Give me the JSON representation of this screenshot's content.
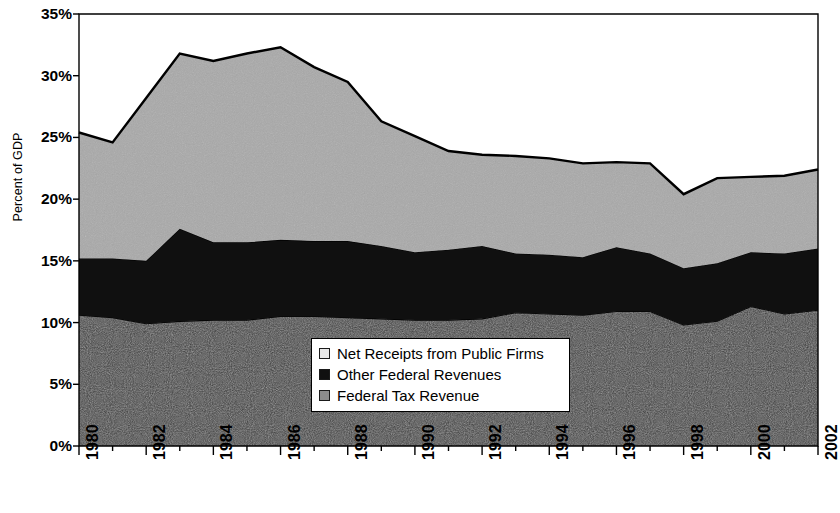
{
  "chart_data": {
    "type": "area",
    "stacked": true,
    "title": "",
    "subtitle": "",
    "xlabel": "",
    "ylabel": "Percent of GDP",
    "xlim": [
      1980,
      2002
    ],
    "ylim": [
      0,
      35
    ],
    "grid": false,
    "legend_position": "inside-bottom-center",
    "ytick_labels": [
      "0%",
      "5%",
      "10%",
      "15%",
      "20%",
      "25%",
      "30%",
      "35%"
    ],
    "ytick_values": [
      0,
      5,
      10,
      15,
      20,
      25,
      30,
      35
    ],
    "xtick_labels": [
      "1980",
      "1982",
      "1984",
      "1986",
      "1988",
      "1990",
      "1992",
      "1994",
      "1996",
      "1998",
      "2000",
      "2002"
    ],
    "xtick_values": [
      1980,
      1982,
      1984,
      1986,
      1988,
      1990,
      1992,
      1994,
      1996,
      1998,
      2000,
      2002
    ],
    "x": [
      1980,
      1981,
      1982,
      1983,
      1984,
      1985,
      1986,
      1987,
      1988,
      1989,
      1990,
      1991,
      1992,
      1993,
      1994,
      1995,
      1996,
      1997,
      1998,
      1999,
      2000,
      2001,
      2002
    ],
    "series": [
      {
        "name": "Federal Tax Revenue",
        "color": "#3c3c3c",
        "values": [
          10.6,
          10.4,
          9.9,
          10.1,
          10.2,
          10.2,
          10.5,
          10.5,
          10.4,
          10.3,
          10.2,
          10.2,
          10.3,
          10.8,
          10.7,
          10.6,
          10.9,
          10.9,
          9.8,
          10.1,
          11.3,
          10.7,
          11.0
        ]
      },
      {
        "name": "Other Federal Revenues",
        "color": "#101010",
        "values": [
          4.6,
          4.8,
          5.1,
          7.5,
          6.3,
          6.3,
          6.2,
          6.1,
          6.2,
          5.9,
          5.5,
          5.7,
          5.9,
          4.8,
          4.8,
          4.7,
          5.2,
          4.7,
          4.6,
          4.7,
          4.4,
          4.9,
          5.0
        ]
      },
      {
        "name": "Net Receipts from Public Firms",
        "color": "#a9a9a9",
        "values": [
          10.2,
          9.4,
          13.2,
          14.2,
          14.7,
          15.3,
          15.6,
          14.1,
          12.9,
          10.1,
          9.4,
          8.0,
          7.4,
          7.9,
          7.8,
          7.6,
          6.9,
          7.3,
          6.0,
          6.9,
          6.1,
          6.3,
          6.4
        ]
      }
    ],
    "totals": [
      25.4,
      24.6,
      28.2,
      31.8,
      31.2,
      31.8,
      32.3,
      30.7,
      29.5,
      26.3,
      25.1,
      23.9,
      23.6,
      23.5,
      23.3,
      22.9,
      23.0,
      22.9,
      20.4,
      21.7,
      21.8,
      21.9,
      22.4
    ]
  },
  "legend": {
    "items": [
      {
        "label": "Net Receipts from Public Firms",
        "swatch": "#e8e8e8"
      },
      {
        "label": "Other Federal Revenues",
        "swatch": "#101010"
      },
      {
        "label": "Federal Tax Revenue",
        "swatch": "#8c8c8c"
      }
    ]
  },
  "axes": {
    "y_title": "Percent of GDP"
  }
}
